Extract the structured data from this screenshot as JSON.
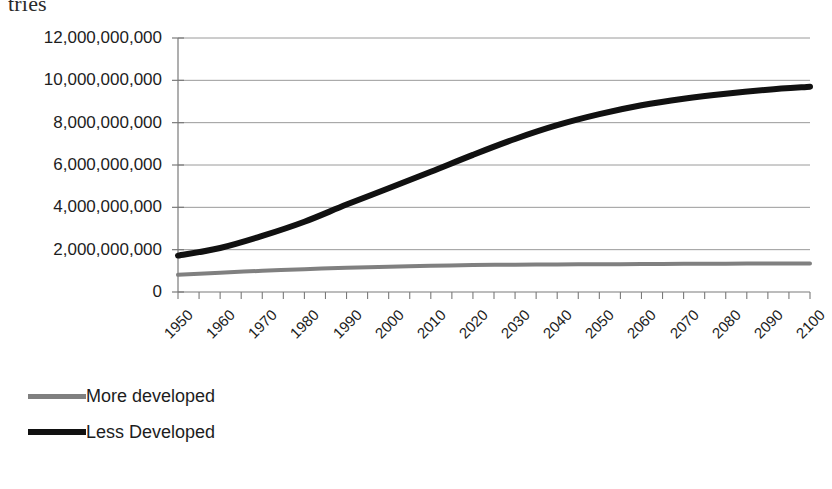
{
  "clipped_heading": "tries",
  "chart_data": {
    "type": "line",
    "title": "",
    "subtitle": "",
    "xlabel": "",
    "ylabel": "",
    "grid": true,
    "legend_position": "bottom-left",
    "xlim": [
      1950,
      2100
    ],
    "ylim": [
      0,
      12000000000
    ],
    "y_ticks": [
      "0",
      "2,000,000,000",
      "4,000,000,000",
      "6,000,000,000",
      "8,000,000,000",
      "10,000,000,000",
      "12,000,000,000"
    ],
    "y_tick_values": [
      0,
      2000000000,
      4000000000,
      6000000000,
      8000000000,
      10000000000,
      12000000000
    ],
    "categories": [
      "1950",
      "1960",
      "1970",
      "1980",
      "1990",
      "2000",
      "2010",
      "2020",
      "2030",
      "2040",
      "2050",
      "2060",
      "2070",
      "2080",
      "2090",
      "2100"
    ],
    "x": [
      1950,
      1960,
      1970,
      1980,
      1990,
      2000,
      2010,
      2020,
      2030,
      2040,
      2050,
      2060,
      2070,
      2080,
      2090,
      2100
    ],
    "series": [
      {
        "name": "More developed",
        "color": "#808080",
        "line_width": 4,
        "values": [
          810000000,
          915000000,
          1000000000,
          1080000000,
          1145000000,
          1190000000,
          1240000000,
          1270000000,
          1290000000,
          1300000000,
          1310000000,
          1320000000,
          1330000000,
          1340000000,
          1345000000,
          1350000000
        ]
      },
      {
        "name": "Less Developed",
        "color": "#111111",
        "line_width": 6,
        "values": [
          1720000000,
          2080000000,
          2650000000,
          3320000000,
          4130000000,
          4900000000,
          5680000000,
          6480000000,
          7230000000,
          7880000000,
          8400000000,
          8820000000,
          9130000000,
          9370000000,
          9560000000,
          9700000000
        ]
      }
    ]
  },
  "legend": {
    "items": [
      {
        "label": "More developed",
        "swatch": "gray-line-swatch"
      },
      {
        "label": "Less Developed",
        "swatch": "black-line-swatch"
      }
    ]
  },
  "axis_colors": {
    "gridline": "#9a9a9a",
    "axis": "#7a7a7a",
    "text": "#1d1d1d"
  }
}
